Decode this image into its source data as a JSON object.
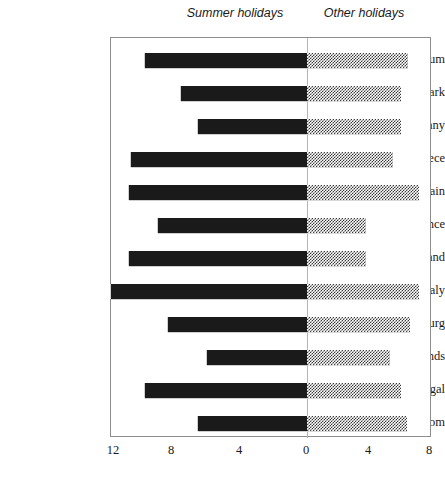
{
  "headers": {
    "left": "Summer holidays",
    "right": "Other holidays"
  },
  "axis": {
    "ticks": [
      {
        "label": "12",
        "x": 113
      },
      {
        "label": "8",
        "x": 171
      },
      {
        "label": "4",
        "x": 239
      },
      {
        "label": "0",
        "x": 306
      },
      {
        "label": "4",
        "x": 368
      },
      {
        "label": "8",
        "x": 429
      }
    ]
  },
  "colors": {
    "summer_bar": "#1a1a1a",
    "other_bar": "#808080",
    "frame": "#8d8d8d",
    "zero_line": "#b5b5b5",
    "background": "#ffffff"
  },
  "chart_data": {
    "type": "bar",
    "title": "",
    "subtitle": "",
    "xlabel": "",
    "ylabel": "",
    "orientation": "horizontal",
    "layout": "diverging-bidirectional",
    "grid": false,
    "legend_position": "top",
    "xlim": [
      -12,
      8
    ],
    "x_ticks": [
      12,
      8,
      4,
      0,
      4,
      8
    ],
    "categories": [
      "Belgium",
      "Denmark",
      "Germany",
      "Greece",
      "Spain",
      "France",
      "Ireland",
      "Italy",
      "Luxemburg",
      "The Netherlands",
      "Portugal",
      "United Kingdom"
    ],
    "series": [
      {
        "name": "Summer holidays",
        "direction": "left",
        "color": "#1a1a1a",
        "values": [
          9.9,
          7.7,
          6.7,
          10.8,
          10.9,
          9.1,
          10.9,
          12.0,
          8.5,
          6.1,
          9.9,
          6.7
        ]
      },
      {
        "name": "Other holidays",
        "direction": "right",
        "color": "#808080",
        "values": [
          6.5,
          6.0,
          6.0,
          5.5,
          7.2,
          3.8,
          3.8,
          7.2,
          6.6,
          5.3,
          6.0,
          6.4
        ]
      }
    ]
  }
}
